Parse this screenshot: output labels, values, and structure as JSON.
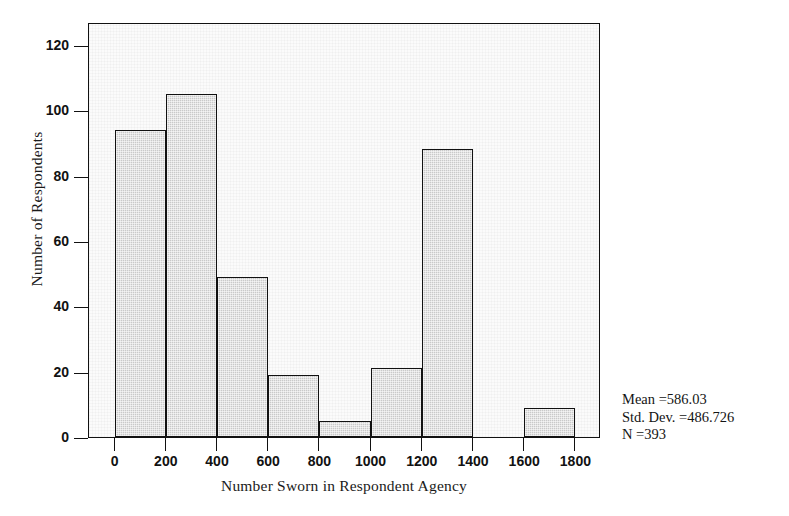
{
  "chart_data": {
    "type": "bar",
    "subtype": "histogram",
    "title": "",
    "xlabel": "Number Sworn in Respondent Agency",
    "ylabel": "Number of Respondents",
    "xlim": [
      -100,
      1900
    ],
    "ylim": [
      0,
      127
    ],
    "grid": false,
    "legend": null,
    "bin_width": 200,
    "x_ticks": [
      0,
      200,
      400,
      600,
      800,
      1000,
      1200,
      1400,
      1600,
      1800
    ],
    "x_tick_labels": [
      "0",
      "200",
      "400",
      "600",
      "800",
      "1000",
      "1200",
      "1400",
      "1600",
      "1800"
    ],
    "y_ticks": [
      0,
      20,
      40,
      60,
      80,
      100,
      120
    ],
    "y_tick_labels": [
      "0",
      "20",
      "40",
      "60",
      "80",
      "100",
      "120"
    ],
    "categories": [
      "0-200",
      "200-400",
      "400-600",
      "600-800",
      "800-1000",
      "1000-1200",
      "1200-1400",
      "1400-1600",
      "1600-1800"
    ],
    "bin_starts": [
      0,
      200,
      400,
      600,
      800,
      1000,
      1200,
      1400,
      1600
    ],
    "bin_ends": [
      200,
      400,
      600,
      800,
      1000,
      1200,
      1400,
      1600,
      1800
    ],
    "values": [
      94,
      105,
      49,
      19,
      5,
      21,
      88,
      0,
      9
    ],
    "bar_fill_color": "#c9c9c9",
    "bar_edge_color": "#111111",
    "plot_background_color": "#fbfbfb",
    "annotations": [
      "Mean =586.03",
      "Std. Dev. =486.726",
      "N =393"
    ]
  },
  "axes": {
    "y_title": "Number of Respondents",
    "x_title": "Number Sworn in Respondent Agency"
  },
  "stats": {
    "mean_line": "Mean =586.03",
    "stddev_line": "Std. Dev. =486.726",
    "n_line": "N =393",
    "mean_value": 586.03,
    "stddev_value": 486.726,
    "n_value": 393
  }
}
